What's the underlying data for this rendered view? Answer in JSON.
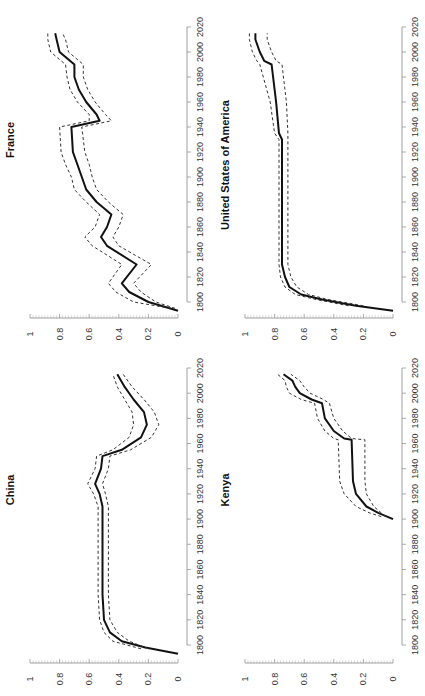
{
  "figure": {
    "orientation": "rotated-90-ccw",
    "panels": [
      {
        "id": "france",
        "title": "France"
      },
      {
        "id": "usa",
        "title": "United States of America"
      },
      {
        "id": "china",
        "title": "China"
      },
      {
        "id": "kenya",
        "title": "Kenya"
      }
    ],
    "year_ticks": [
      "1800",
      "1820",
      "1840",
      "1860",
      "1880",
      "1900",
      "1920",
      "1940",
      "1960",
      "1980",
      "2000",
      "2020"
    ],
    "value_ticks": [
      "0",
      "0.2",
      "0.4",
      "0.6",
      "0.8",
      "1"
    ]
  },
  "chart_data": [
    {
      "type": "line",
      "title": "France",
      "xlabel": "",
      "ylabel": "",
      "xlim": [
        1790,
        2020
      ],
      "ylim": [
        0,
        1
      ],
      "x_ticks": [
        1800,
        1820,
        1840,
        1860,
        1880,
        1900,
        1920,
        1940,
        1960,
        1980,
        2000,
        2020
      ],
      "y_ticks": [
        0,
        0.2,
        0.4,
        0.6,
        0.8,
        1
      ],
      "series": [
        {
          "name": "estimate",
          "style": "solid",
          "x": [
            1793,
            1800,
            1808,
            1815,
            1830,
            1845,
            1852,
            1860,
            1870,
            1880,
            1890,
            1900,
            1910,
            1920,
            1940,
            1945,
            1950,
            1960,
            1970,
            1980,
            1990,
            2000,
            2010,
            2015
          ],
          "values": [
            0.0,
            0.2,
            0.33,
            0.38,
            0.28,
            0.48,
            0.52,
            0.48,
            0.45,
            0.55,
            0.62,
            0.65,
            0.68,
            0.71,
            0.72,
            0.53,
            0.55,
            0.62,
            0.67,
            0.7,
            0.7,
            0.8,
            0.82,
            0.83
          ]
        },
        {
          "name": "upper bound",
          "style": "dashed",
          "x": [
            1795,
            1800,
            1808,
            1815,
            1830,
            1845,
            1852,
            1860,
            1870,
            1880,
            1890,
            1900,
            1910,
            1920,
            1940,
            1945,
            1950,
            1960,
            1970,
            1980,
            1990,
            2000,
            2010,
            2015
          ],
          "values": [
            0.05,
            0.3,
            0.42,
            0.47,
            0.38,
            0.58,
            0.63,
            0.56,
            0.53,
            0.62,
            0.7,
            0.72,
            0.76,
            0.79,
            0.8,
            0.6,
            0.6,
            0.68,
            0.73,
            0.75,
            0.76,
            0.86,
            0.88,
            0.88
          ]
        },
        {
          "name": "lower bound",
          "style": "dashed",
          "x": [
            1795,
            1800,
            1808,
            1815,
            1830,
            1845,
            1852,
            1860,
            1870,
            1880,
            1890,
            1900,
            1910,
            1920,
            1940,
            1945,
            1950,
            1960,
            1970,
            1980,
            1990,
            2000,
            2010,
            2015
          ],
          "values": [
            0.02,
            0.15,
            0.25,
            0.3,
            0.18,
            0.4,
            0.44,
            0.4,
            0.37,
            0.47,
            0.55,
            0.58,
            0.6,
            0.63,
            0.65,
            0.45,
            0.49,
            0.56,
            0.61,
            0.64,
            0.64,
            0.74,
            0.76,
            0.78
          ]
        }
      ]
    },
    {
      "type": "line",
      "title": "United States of America",
      "xlabel": "",
      "ylabel": "",
      "xlim": [
        1790,
        2020
      ],
      "ylim": [
        0,
        1
      ],
      "x_ticks": [
        1800,
        1820,
        1840,
        1860,
        1880,
        1900,
        1920,
        1940,
        1960,
        1980,
        2000,
        2020
      ],
      "y_ticks": [
        0,
        0.2,
        0.4,
        0.6,
        0.8,
        1
      ],
      "series": [
        {
          "name": "estimate",
          "style": "solid",
          "x": [
            1793,
            1797,
            1802,
            1806,
            1812,
            1820,
            1830,
            1860,
            1900,
            1930,
            1935,
            1960,
            1990,
            1993,
            2000,
            2010,
            2015
          ],
          "values": [
            0.0,
            0.25,
            0.48,
            0.62,
            0.7,
            0.73,
            0.75,
            0.75,
            0.75,
            0.75,
            0.77,
            0.79,
            0.82,
            0.87,
            0.9,
            0.93,
            0.93
          ]
        },
        {
          "name": "upper bound",
          "style": "dashed",
          "x": [
            1797,
            1802,
            1806,
            1812,
            1820,
            1830,
            1860,
            1900,
            1930,
            1935,
            1960,
            1990,
            1993,
            2000,
            2010,
            2015
          ],
          "values": [
            0.3,
            0.52,
            0.66,
            0.73,
            0.76,
            0.77,
            0.77,
            0.77,
            0.77,
            0.8,
            0.83,
            0.9,
            0.92,
            0.95,
            0.97,
            0.97
          ]
        },
        {
          "name": "lower bound",
          "style": "dashed",
          "x": [
            1797,
            1802,
            1806,
            1812,
            1820,
            1830,
            1860,
            1900,
            1930,
            1935,
            1960,
            1990,
            1993,
            2000,
            2010,
            2015
          ],
          "values": [
            0.2,
            0.44,
            0.57,
            0.65,
            0.69,
            0.71,
            0.71,
            0.71,
            0.71,
            0.71,
            0.72,
            0.75,
            0.79,
            0.82,
            0.85,
            0.85
          ]
        }
      ]
    },
    {
      "type": "line",
      "title": "China",
      "xlabel": "",
      "ylabel": "",
      "xlim": [
        1790,
        2020
      ],
      "ylim": [
        0,
        1
      ],
      "x_ticks": [
        1800,
        1820,
        1840,
        1860,
        1880,
        1900,
        1920,
        1940,
        1960,
        1980,
        2000,
        2020
      ],
      "y_ticks": [
        0,
        0.2,
        0.4,
        0.6,
        0.8,
        1
      ],
      "series": [
        {
          "name": "estimate",
          "style": "solid",
          "x": [
            1793,
            1798,
            1803,
            1810,
            1820,
            1840,
            1880,
            1910,
            1920,
            1928,
            1940,
            1950,
            1955,
            1965,
            1975,
            1985,
            1995,
            2005,
            2015
          ],
          "values": [
            0.0,
            0.22,
            0.38,
            0.46,
            0.5,
            0.51,
            0.51,
            0.51,
            0.53,
            0.56,
            0.52,
            0.51,
            0.38,
            0.25,
            0.21,
            0.23,
            0.3,
            0.36,
            0.41
          ]
        },
        {
          "name": "upper bound",
          "style": "dashed",
          "x": [
            1797,
            1803,
            1810,
            1820,
            1840,
            1880,
            1910,
            1920,
            1928,
            1940,
            1950,
            1955,
            1965,
            1975,
            1985,
            1995,
            2005,
            2015
          ],
          "values": [
            0.25,
            0.44,
            0.5,
            0.53,
            0.54,
            0.54,
            0.54,
            0.57,
            0.61,
            0.56,
            0.55,
            0.44,
            0.33,
            0.3,
            0.31,
            0.36,
            0.41,
            0.44
          ]
        },
        {
          "name": "lower bound",
          "style": "dashed",
          "x": [
            1797,
            1803,
            1810,
            1820,
            1840,
            1880,
            1910,
            1920,
            1928,
            1940,
            1950,
            1955,
            1965,
            1975,
            1985,
            1995,
            2005,
            2015
          ],
          "values": [
            0.2,
            0.33,
            0.41,
            0.46,
            0.47,
            0.47,
            0.47,
            0.49,
            0.51,
            0.47,
            0.46,
            0.32,
            0.18,
            0.13,
            0.16,
            0.23,
            0.31,
            0.37
          ]
        }
      ]
    },
    {
      "type": "line",
      "title": "Kenya",
      "xlabel": "",
      "ylabel": "",
      "xlim": [
        1790,
        2020
      ],
      "ylim": [
        0,
        1
      ],
      "x_ticks": [
        1800,
        1820,
        1840,
        1860,
        1880,
        1900,
        1920,
        1940,
        1960,
        1980,
        2000,
        2020
      ],
      "y_ticks": [
        0,
        0.2,
        0.4,
        0.6,
        0.8,
        1
      ],
      "series": [
        {
          "name": "estimate",
          "style": "solid",
          "x": [
            1900,
            1905,
            1910,
            1920,
            1930,
            1963,
            1964,
            1970,
            1980,
            1992,
            1995,
            2000,
            2005,
            2010,
            2015
          ],
          "values": [
            0.0,
            0.1,
            0.18,
            0.25,
            0.27,
            0.28,
            0.33,
            0.4,
            0.46,
            0.48,
            0.55,
            0.63,
            0.66,
            0.68,
            0.74
          ]
        },
        {
          "name": "upper bound",
          "style": "dashed",
          "x": [
            1902,
            1905,
            1910,
            1920,
            1930,
            1963,
            1964,
            1970,
            1980,
            1992,
            1995,
            2000,
            2005,
            2010,
            2015
          ],
          "values": [
            0.08,
            0.16,
            0.25,
            0.33,
            0.36,
            0.37,
            0.4,
            0.46,
            0.51,
            0.53,
            0.62,
            0.7,
            0.72,
            0.73,
            0.78
          ]
        },
        {
          "name": "lower bound",
          "style": "dashed",
          "x": [
            1902,
            1905,
            1910,
            1920,
            1930,
            1963,
            1964,
            1970,
            1980,
            1992,
            1995,
            2000,
            2005,
            2010,
            2015
          ],
          "values": [
            0.05,
            0.08,
            0.13,
            0.18,
            0.19,
            0.19,
            0.28,
            0.34,
            0.4,
            0.43,
            0.47,
            0.56,
            0.6,
            0.63,
            0.69
          ]
        }
      ]
    }
  ]
}
